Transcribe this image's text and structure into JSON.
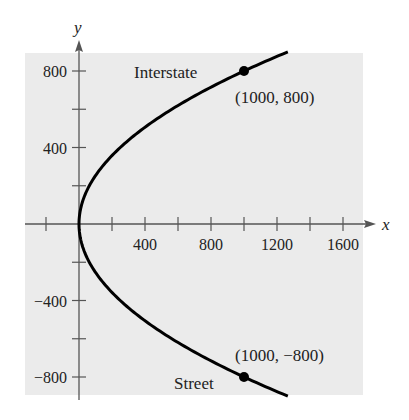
{
  "chart_data": {
    "type": "line",
    "title": "",
    "xlabel": "x",
    "ylabel": "y",
    "xlim": [
      -250,
      1700
    ],
    "ylim": [
      -900,
      900
    ],
    "x_ticks": [
      -200,
      0,
      200,
      400,
      600,
      800,
      1000,
      1200,
      1400,
      1600
    ],
    "x_tick_labels": [
      "400",
      "800",
      "1200",
      "1600"
    ],
    "x_tick_label_values": [
      400,
      800,
      1200,
      1600
    ],
    "y_ticks": [
      -800,
      -600,
      -400,
      -200,
      200,
      400,
      600,
      800
    ],
    "y_tick_labels": [
      "800",
      "400",
      "−400",
      "−800"
    ],
    "y_tick_label_values": [
      800,
      400,
      -400,
      -800
    ],
    "grid": false,
    "series": [
      {
        "name": "parabola x = y^2/640",
        "equation": "x = y^2 / 640",
        "y_range": [
          -900,
          900
        ]
      }
    ],
    "points": [
      {
        "x": 1000,
        "y": 800,
        "label": "(1000, 800)",
        "name": "Interstate"
      },
      {
        "x": 1000,
        "y": -800,
        "label": "(1000, −800)",
        "name": "Street"
      }
    ],
    "annotations": [
      "Interstate",
      "Street",
      "(1000, 800)",
      "(1000, −800)"
    ],
    "colors": {
      "panel": "#ebebeb",
      "curve": "#000000",
      "axis": "#555555"
    }
  }
}
